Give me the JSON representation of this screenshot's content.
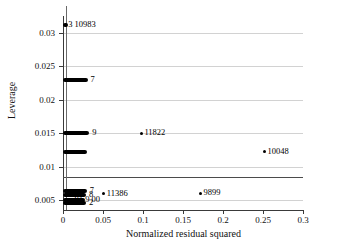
{
  "chart_data": {
    "type": "scatter",
    "title": "",
    "xlabel": "Normalized residual squared",
    "ylabel": "Leverage",
    "xlim": [
      0,
      0.3
    ],
    "ylim": [
      0.0035,
      0.0325
    ],
    "xticks": [
      "0",
      "0.05",
      "0.1",
      "0.15",
      "0.2",
      "0.25",
      "0.3"
    ],
    "xtick_values": [
      0,
      0.05,
      0.1,
      0.15,
      0.2,
      0.25,
      0.3
    ],
    "yticks": [
      "0.005",
      "0.01",
      "0.015",
      "0.02",
      "0.025",
      "0.03"
    ],
    "ytick_values": [
      0.005,
      0.01,
      0.015,
      0.02,
      0.025,
      0.03
    ],
    "grid": "horizontal",
    "legend": "none",
    "reference_lines": {
      "horizontal_mean_leverage": 0.0085,
      "vertical_mean_residual": 0.004
    },
    "labeled_points": [
      {
        "label": "11822",
        "x": 0.098,
        "y": 0.015
      },
      {
        "label": "10048",
        "x": 0.252,
        "y": 0.0122
      },
      {
        "label": "9899",
        "x": 0.172,
        "y": 0.006
      },
      {
        "label": "11386",
        "x": 0.051,
        "y": 0.0059
      }
    ],
    "overprinted_labels": [
      {
        "label": "3 10983",
        "x": 0.004,
        "y": 0.0311,
        "note": "overlapping ids at top band"
      },
      {
        "label": "7",
        "x": 0.032,
        "y": 0.023,
        "note": "overlapping ids"
      },
      {
        "label": "9",
        "x": 0.034,
        "y": 0.015,
        "note": "overlapping ids"
      },
      {
        "label": "7",
        "x": 0.031,
        "y": 0.0063,
        "note": "overlapping ids"
      },
      {
        "label": "8",
        "x": 0.03,
        "y": 0.0058,
        "note": "overlapping ids"
      },
      {
        "label": "01 9 00",
        "x": 0.012,
        "y": 0.005,
        "note": "overlapping ids"
      },
      {
        "label": "2",
        "x": 0.03,
        "y": 0.0045,
        "note": "overlapping ids"
      }
    ],
    "dense_bands": [
      {
        "y": 0.0311,
        "x_start": 0.0,
        "x_end": 0.006
      },
      {
        "y": 0.023,
        "x_start": 0.0,
        "x_end": 0.031
      },
      {
        "y": 0.015,
        "x_start": 0.0,
        "x_end": 0.033
      },
      {
        "y": 0.0122,
        "x_start": 0.0,
        "x_end": 0.03
      },
      {
        "y": 0.0063,
        "x_start": 0.0,
        "x_end": 0.03
      },
      {
        "y": 0.0058,
        "x_start": 0.0,
        "x_end": 0.029
      },
      {
        "y": 0.005,
        "x_start": 0.0,
        "x_end": 0.028
      },
      {
        "y": 0.0045,
        "x_start": 0.0,
        "x_end": 0.029
      }
    ],
    "colors": {
      "marker": "#000000",
      "grid": "#d2d2d2",
      "axis": "#3a3a3a",
      "reference_line": "#4b4b4b",
      "background": "#ffffff"
    }
  }
}
